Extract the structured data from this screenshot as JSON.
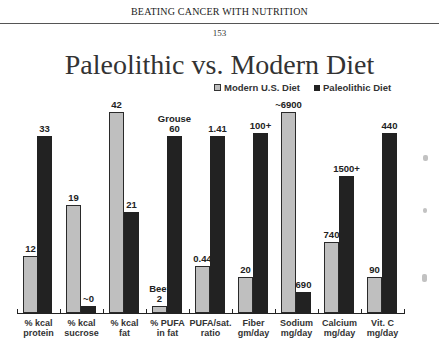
{
  "page": {
    "running_head": "BEATING CANCER WITH NUTRITION",
    "page_number": "153"
  },
  "chart_data": {
    "type": "bar",
    "title": "Paleolithic vs. Modern Diet",
    "xlabel": "",
    "ylabel": "",
    "grid": false,
    "legend_position": "top-right",
    "legend": [
      "Modern U.S. Diet",
      "Paleolithic Diet"
    ],
    "categories": [
      "% kcal protein",
      "% kcal sucrose",
      "% kcal fat",
      "% PUFA in fat",
      "PUFA/sat. ratio",
      "Fiber gm/day",
      "Sodium mg/day",
      "Calcium mg/day",
      "Vit. C mg/day"
    ],
    "category_lines": [
      [
        "% kcal",
        "protein"
      ],
      [
        "% kcal",
        "sucrose"
      ],
      [
        "% kcal",
        "fat"
      ],
      [
        "% PUFA",
        "in fat"
      ],
      [
        "PUFA/sat.",
        "ratio"
      ],
      [
        "Fiber",
        "gm/day"
      ],
      [
        "Sodium",
        "mg/day"
      ],
      [
        "Calcium",
        "mg/day"
      ],
      [
        "Vit. C",
        "mg/day"
      ]
    ],
    "series": [
      {
        "name": "Modern U.S. Diet",
        "color": "#bfbfbf",
        "values": [
          12,
          19,
          42,
          2,
          0.44,
          20,
          6900,
          740,
          90
        ],
        "labels": [
          "12",
          "19",
          "42",
          "Beef 2",
          "0.44",
          "20",
          "~6900",
          "740",
          "90"
        ]
      },
      {
        "name": "Paleolithic Diet",
        "color": "#222222",
        "values": [
          33,
          0,
          21,
          60,
          1.41,
          100,
          690,
          1500,
          440
        ],
        "labels": [
          "33",
          "~0",
          "21",
          "Grouse 60",
          "1.41",
          "100+",
          "690",
          "1500+",
          "440"
        ]
      }
    ]
  },
  "bars": [
    {
      "cat": 0,
      "series": "modern",
      "label": "12",
      "x": 23,
      "top": 256
    },
    {
      "cat": 0,
      "series": "paleo",
      "label": "33",
      "x": 37,
      "top": 136
    },
    {
      "cat": 1,
      "series": "modern",
      "label": "19",
      "x": 66,
      "top": 205
    },
    {
      "cat": 1,
      "series": "paleo",
      "label": "~0",
      "x": 81,
      "top": 306
    },
    {
      "cat": 2,
      "series": "modern",
      "label": "42",
      "x": 109,
      "top": 112
    },
    {
      "cat": 2,
      "series": "paleo",
      "label": "21",
      "x": 124,
      "top": 212
    },
    {
      "cat": 3,
      "series": "modern",
      "label": "2",
      "note": "Beef",
      "x": 152,
      "top": 306
    },
    {
      "cat": 3,
      "series": "paleo",
      "label": "60",
      "note": "Grouse",
      "x": 167,
      "top": 136
    },
    {
      "cat": 4,
      "series": "modern",
      "label": "0.44",
      "x": 195,
      "top": 266
    },
    {
      "cat": 4,
      "series": "paleo",
      "label": "1.41",
      "x": 210,
      "top": 136
    },
    {
      "cat": 5,
      "series": "modern",
      "label": "20",
      "x": 238,
      "top": 277
    },
    {
      "cat": 5,
      "series": "paleo",
      "label": "100+",
      "x": 253,
      "top": 133
    },
    {
      "cat": 6,
      "series": "modern",
      "label": "~6900",
      "x": 281,
      "top": 112
    },
    {
      "cat": 6,
      "series": "paleo",
      "label": "690",
      "x": 296,
      "top": 292
    },
    {
      "cat": 7,
      "series": "modern",
      "label": "740",
      "x": 324,
      "top": 242
    },
    {
      "cat": 7,
      "series": "paleo",
      "label": "1500+",
      "x": 339,
      "top": 176
    },
    {
      "cat": 8,
      "series": "modern",
      "label": "90",
      "x": 367,
      "top": 277
    },
    {
      "cat": 8,
      "series": "paleo",
      "label": "440",
      "x": 382,
      "top": 133
    }
  ]
}
